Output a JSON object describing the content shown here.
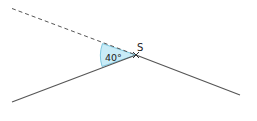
{
  "diagram": {
    "vertex_label": "S",
    "angle_label": "40°",
    "angle_degrees": 40,
    "colors": {
      "line": "#555555",
      "wedge_fill": "#c9ecf7",
      "wedge_stroke": "#7fc8e0",
      "text": "#222222"
    }
  }
}
